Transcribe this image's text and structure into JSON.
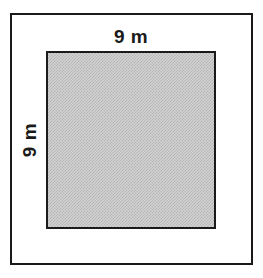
{
  "figure": {
    "type": "geometry-diagram",
    "outer_frame": {
      "name": "outer-border-rectangle",
      "border_color": "#1a1a1a",
      "fill_color": "#ffffff"
    },
    "shape": {
      "name": "shaded-square",
      "sides": 4,
      "fill_color": "#d2d2d2",
      "fill_pattern": "fine-checkerboard-dither",
      "border_color": "#1a1a1a"
    },
    "labels": {
      "top": "9 m",
      "left": "9 m"
    },
    "dimensions": {
      "width_value": 9,
      "height_value": 9,
      "unit": "m"
    }
  }
}
